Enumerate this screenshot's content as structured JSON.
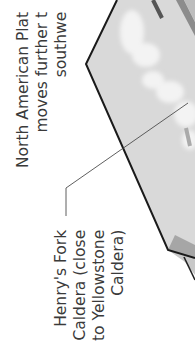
{
  "diagram": {
    "type": "rotated geologic block diagram fragment",
    "orientation": "content rotated 90deg counter-clockwise",
    "colors": {
      "background": "#ffffff",
      "plate_surface": "#d9d9d9",
      "plate_highlight": "#f2f2f2",
      "plate_edge": "#1a1a1a",
      "plate_side_dark": "#8c8c8c",
      "plate_side_light": "#bdbdbd",
      "leader_line": "#4d4d4d",
      "text": "#3a3a3a"
    },
    "labels": {
      "plate_motion": {
        "lines": [
          "North American Plat",
          "moves further t",
          "southwe"
        ]
      },
      "caldera": {
        "lines": [
          "Henry's Fork",
          "Caldera (close",
          "to Yellowstone",
          "Caldera)"
        ]
      }
    }
  }
}
